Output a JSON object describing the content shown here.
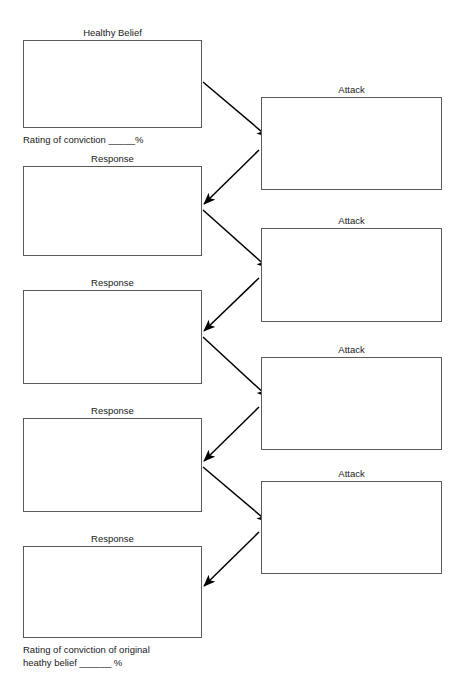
{
  "document": {
    "title": "Healthy Belief Attack and Response Worksheet",
    "background_color": "#ffffff",
    "box_border_color": "#5a5a5a",
    "arrow_color": "#000000",
    "text_color": "#1a1a1a"
  },
  "left_column": {
    "nodes": [
      {
        "label": "Healthy Belief",
        "value": ""
      },
      {
        "label": "Response",
        "value": ""
      },
      {
        "label": "Response",
        "value": ""
      },
      {
        "label": "Response",
        "value": ""
      },
      {
        "label": "Response",
        "value": ""
      }
    ]
  },
  "right_column": {
    "nodes": [
      {
        "label": "Attack",
        "value": ""
      },
      {
        "label": "Attack",
        "value": ""
      },
      {
        "label": "Attack",
        "value": ""
      },
      {
        "label": "Attack",
        "value": ""
      }
    ]
  },
  "captions": {
    "top_rating": "Rating of conviction _____%",
    "bottom_rating": "Rating of conviction of original\nheathy belief ______ %"
  },
  "arrows": [
    {
      "from": "healthy-belief",
      "to": "attack-1",
      "direction": "right-down"
    },
    {
      "from": "attack-1",
      "to": "response-1",
      "direction": "left-down"
    },
    {
      "from": "response-1",
      "to": "attack-2",
      "direction": "right-down"
    },
    {
      "from": "attack-2",
      "to": "response-2",
      "direction": "left-down"
    },
    {
      "from": "response-2",
      "to": "attack-3",
      "direction": "right-down"
    },
    {
      "from": "attack-3",
      "to": "response-3",
      "direction": "left-down"
    },
    {
      "from": "response-3",
      "to": "attack-4",
      "direction": "right-down"
    },
    {
      "from": "attack-4",
      "to": "response-4",
      "direction": "left-down"
    }
  ]
}
